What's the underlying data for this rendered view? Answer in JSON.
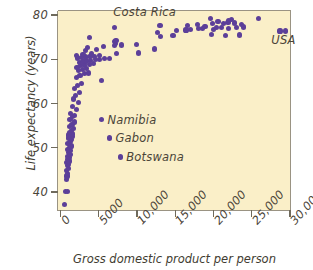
{
  "chart_data": {
    "type": "scatter",
    "title": "",
    "xlabel": "Gross domestic product per person",
    "ylabel": "Life expectancy (years)",
    "xlim": [
      0,
      30000
    ],
    "ylim": [
      36,
      81
    ],
    "grid": false,
    "legend": "none",
    "point_color": "#5c3f99",
    "plot_background": "#faefc8",
    "xticks": [
      {
        "value": 0,
        "label": "0"
      },
      {
        "value": 5000,
        "label": "5000"
      },
      {
        "value": 10000,
        "label": "10,000"
      },
      {
        "value": 15000,
        "label": "15,000"
      },
      {
        "value": 20000,
        "label": "20,000"
      },
      {
        "value": 25000,
        "label": "25,000"
      },
      {
        "value": 30000,
        "label": "30,000"
      }
    ],
    "yticks": [
      {
        "value": 80,
        "label": "80"
      },
      {
        "value": 70,
        "label": "70"
      },
      {
        "value": 60,
        "label": "60"
      },
      {
        "value": 50,
        "label": "50"
      },
      {
        "value": 40,
        "label": "40"
      }
    ],
    "annotations": [
      {
        "label": "Costa Rica",
        "x": 3500,
        "y": 80.2,
        "text_only": true,
        "text_dx": 26,
        "text_dy": -2
      },
      {
        "label": "USA",
        "x": 28600,
        "y": 75.1,
        "text_only": true,
        "text_dx": -8,
        "text_dy": 3
      },
      {
        "label": "Namibia",
        "x": 5350,
        "y": 56.3,
        "text_only": false,
        "text_dx": 6,
        "text_dy": 0
      },
      {
        "label": "Gabon",
        "x": 6400,
        "y": 52.2,
        "text_only": false,
        "text_dx": 6,
        "text_dy": 0
      },
      {
        "label": "Botswana",
        "x": 7800,
        "y": 47.9,
        "text_only": false,
        "text_dx": 6,
        "text_dy": 0
      }
    ],
    "points": [
      [
        480,
        37.2
      ],
      [
        620,
        40.1
      ],
      [
        900,
        40.2
      ],
      [
        780,
        42.8
      ],
      [
        860,
        43.6
      ],
      [
        960,
        44.2
      ],
      [
        820,
        44.8
      ],
      [
        1010,
        45.3
      ],
      [
        900,
        45.9
      ],
      [
        1060,
        46.3
      ],
      [
        840,
        46.7
      ],
      [
        1120,
        47.0
      ],
      [
        960,
        47.4
      ],
      [
        1180,
        47.8
      ],
      [
        900,
        48.1
      ],
      [
        1240,
        48.5
      ],
      [
        1040,
        48.9
      ],
      [
        1300,
        49.3
      ],
      [
        880,
        49.6
      ],
      [
        1150,
        50.0
      ],
      [
        1380,
        50.4
      ],
      [
        980,
        50.9
      ],
      [
        1260,
        51.4
      ],
      [
        1460,
        51.8
      ],
      [
        1060,
        52.2
      ],
      [
        1340,
        52.4
      ],
      [
        1540,
        52.6
      ],
      [
        1100,
        52.9
      ],
      [
        1620,
        53.1
      ],
      [
        1220,
        53.5
      ],
      [
        1420,
        53.9
      ],
      [
        1700,
        54.4
      ],
      [
        1160,
        54.8
      ],
      [
        1500,
        55.3
      ],
      [
        1780,
        55.8
      ],
      [
        1240,
        56.4
      ],
      [
        1600,
        57.0
      ],
      [
        1880,
        57.3
      ],
      [
        1320,
        57.8
      ],
      [
        2100,
        58.6
      ],
      [
        1560,
        59.4
      ],
      [
        2300,
        60.2
      ],
      [
        1700,
        61.0
      ],
      [
        1980,
        61.8
      ],
      [
        2450,
        62.5
      ],
      [
        1820,
        63.3
      ],
      [
        2250,
        64.1
      ],
      [
        2700,
        64.6
      ],
      [
        5400,
        65.2
      ],
      [
        2050,
        65.9
      ],
      [
        2550,
        66.4
      ],
      [
        3100,
        66.8
      ],
      [
        3700,
        66.9
      ],
      [
        2350,
        67.4
      ],
      [
        2850,
        67.7
      ],
      [
        3350,
        67.9
      ],
      [
        2150,
        68.2
      ],
      [
        2650,
        68.5
      ],
      [
        3150,
        68.7
      ],
      [
        3750,
        68.9
      ],
      [
        4350,
        69.1
      ],
      [
        2450,
        69.3
      ],
      [
        2950,
        69.5
      ],
      [
        3450,
        69.6
      ],
      [
        3950,
        69.8
      ],
      [
        4550,
        69.9
      ],
      [
        5100,
        70.0
      ],
      [
        5800,
        70.1
      ],
      [
        2250,
        70.3
      ],
      [
        2750,
        70.4
      ],
      [
        3250,
        70.5
      ],
      [
        3850,
        70.6
      ],
      [
        4450,
        70.7
      ],
      [
        5050,
        70.8
      ],
      [
        6400,
        70.1
      ],
      [
        2050,
        70.9
      ],
      [
        2950,
        71.1
      ],
      [
        4050,
        71.2
      ],
      [
        7300,
        71.3
      ],
      [
        10200,
        71.4
      ],
      [
        3250,
        71.9
      ],
      [
        4750,
        72.2
      ],
      [
        12300,
        72.3
      ],
      [
        3500,
        72.7
      ],
      [
        5600,
        72.9
      ],
      [
        7100,
        73.1
      ],
      [
        8000,
        73.2
      ],
      [
        7200,
        73.5
      ],
      [
        9900,
        73.4
      ],
      [
        7100,
        74.0
      ],
      [
        7250,
        74.3
      ],
      [
        3800,
        75.0
      ],
      [
        13100,
        75.2
      ],
      [
        14700,
        75.3
      ],
      [
        21600,
        75.4
      ],
      [
        23400,
        75.5
      ],
      [
        19700,
        75.6
      ],
      [
        12700,
        76.0
      ],
      [
        16400,
        76.6
      ],
      [
        17000,
        76.7
      ],
      [
        18000,
        76.9
      ],
      [
        20000,
        76.7
      ],
      [
        20400,
        77.1
      ],
      [
        21000,
        77.2
      ],
      [
        22000,
        77.0
      ],
      [
        23000,
        77.1
      ],
      [
        28700,
        76.4
      ],
      [
        29400,
        76.4
      ],
      [
        7100,
        77.1
      ],
      [
        13000,
        77.7
      ],
      [
        16600,
        77.6
      ],
      [
        18900,
        77.4
      ],
      [
        19900,
        78.0
      ],
      [
        21300,
        78.1
      ],
      [
        21900,
        78.3
      ],
      [
        22700,
        78.2
      ],
      [
        23700,
        77.9
      ],
      [
        23900,
        77.3
      ],
      [
        20600,
        78.6
      ],
      [
        22400,
        79.0
      ],
      [
        25900,
        79.3
      ],
      [
        19600,
        79.2
      ],
      [
        22000,
        78.8
      ],
      [
        18600,
        77.0
      ],
      [
        15200,
        76.5
      ],
      [
        17900,
        77.8
      ]
    ]
  }
}
